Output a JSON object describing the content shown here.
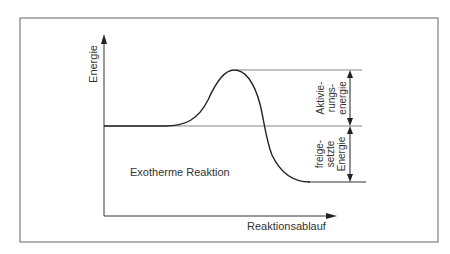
{
  "diagram": {
    "type": "energy-profile",
    "y_axis_label": "Energie",
    "x_axis_label": "Reaktionsablauf",
    "reaction_label": "Exotherme Reaktion",
    "activation_energy_label": [
      "Aktivie-",
      "rungs-",
      "energie"
    ],
    "released_energy_label": [
      "freige-",
      "setzte",
      "Energie"
    ],
    "colors": {
      "line": "#222222",
      "frame": "#555555",
      "guide": "#777777",
      "background": "#ffffff"
    },
    "levels": {
      "reactant": "start energy level",
      "transition_state": "peak",
      "product": "lower end energy level"
    }
  }
}
